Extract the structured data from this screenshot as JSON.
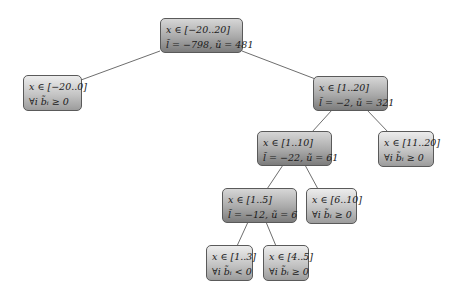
{
  "tree": {
    "nodes": [
      {
        "id": "root",
        "line1": "x ∈ [−20..20]",
        "line2": "l̃ = −798, ũ = 481",
        "type": "inner",
        "x": 160,
        "y": 18,
        "w": 83,
        "h": 35
      },
      {
        "id": "n-20-0",
        "line1": "x ∈ [−20..0]",
        "line2": "∀i b̃ᵢ ≥ 0",
        "type": "leaf",
        "x": 23,
        "y": 75,
        "w": 59,
        "h": 36
      },
      {
        "id": "n1-20",
        "line1": "x ∈ [1..20]",
        "line2": "l̃ = −2, ũ = 321",
        "type": "inner",
        "x": 313,
        "y": 76,
        "w": 75,
        "h": 35
      },
      {
        "id": "n1-10",
        "line1": "x ∈ [1..10]",
        "line2": "l̃ = −22, ũ = 61",
        "type": "inner",
        "x": 257,
        "y": 131,
        "w": 75,
        "h": 35
      },
      {
        "id": "n11-20",
        "line1": "x ∈ [11..20]",
        "line2": "∀i b̃ᵢ ≥ 0",
        "type": "leaf",
        "x": 378,
        "y": 131,
        "w": 56,
        "h": 36
      },
      {
        "id": "n1-5",
        "line1": "x ∈ [1..5]",
        "line2": "l̃ = −12, ũ = 6",
        "type": "inner",
        "x": 222,
        "y": 188,
        "w": 75,
        "h": 35
      },
      {
        "id": "n6-10",
        "line1": "x ∈ [6..10]",
        "line2": "∀i b̃ᵢ ≥ 0",
        "type": "leaf",
        "x": 306,
        "y": 188,
        "w": 51,
        "h": 36
      },
      {
        "id": "n1-3",
        "line1": "x ∈ [1..3]",
        "line2": "∀i b̃ᵢ < 0",
        "type": "leaf",
        "x": 206,
        "y": 245,
        "w": 47,
        "h": 36
      },
      {
        "id": "n4-5",
        "line1": "x ∈ [4..5]",
        "line2": "∀i b̃ᵢ ≥ 0",
        "type": "leaf",
        "x": 263,
        "y": 245,
        "w": 46,
        "h": 36
      }
    ],
    "edges": [
      {
        "from": "root",
        "to": "n-20-0",
        "x1": 160,
        "y1": 51,
        "x2": 81,
        "y2": 80
      },
      {
        "from": "root",
        "to": "n1-20",
        "x1": 242,
        "y1": 51,
        "x2": 318,
        "y2": 80
      },
      {
        "from": "n1-20",
        "to": "n1-10",
        "x1": 332,
        "y1": 110,
        "x2": 312,
        "y2": 132
      },
      {
        "from": "n1-20",
        "to": "n11-20",
        "x1": 367,
        "y1": 110,
        "x2": 388,
        "y2": 132
      },
      {
        "from": "n1-10",
        "to": "n1-5",
        "x1": 283,
        "y1": 165,
        "x2": 267,
        "y2": 189
      },
      {
        "from": "n1-10",
        "to": "n6-10",
        "x1": 305,
        "y1": 165,
        "x2": 318,
        "y2": 189
      },
      {
        "from": "n1-5",
        "to": "n1-3",
        "x1": 248,
        "y1": 222,
        "x2": 237,
        "y2": 246
      },
      {
        "from": "n1-5",
        "to": "n4-5",
        "x1": 266,
        "y1": 222,
        "x2": 276,
        "y2": 246
      }
    ],
    "colors": {
      "edge": "#6e6e6e",
      "border": "#5a5a5a"
    }
  }
}
